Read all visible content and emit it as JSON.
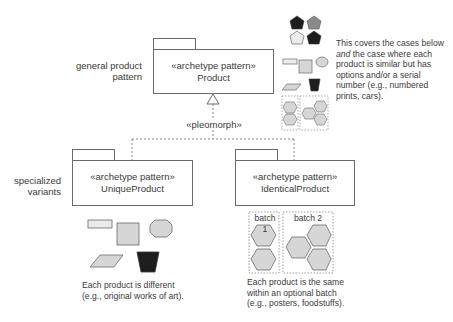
{
  "diagram": {
    "general": {
      "side_label_line1": "general product",
      "side_label_line2": "pattern",
      "stereotype": "«archetype pattern»",
      "name": "Product"
    },
    "relationship": {
      "label": "«pleomorph»"
    },
    "specialized": {
      "side_label_line1": "specialized",
      "side_label_line2": "variants"
    },
    "unique": {
      "stereotype": "«archetype pattern»",
      "name": "UniqueProduct",
      "caption_line1": "Each product is different",
      "caption_line2": "(e.g., original works of art)."
    },
    "identical": {
      "stereotype": "«archetype pattern»",
      "name": "IdenticalProduct",
      "batch1_label": "batch 1",
      "batch2_label": "batch 2",
      "caption_line1": "Each product is the same",
      "caption_line2": "within an optional batch",
      "caption_line3": "(e.g., posters, foodstuffs)."
    },
    "general_note": {
      "line1": "This covers the cases below",
      "line2_italic": "and",
      "line2_rest": " the case where each",
      "line3": "product is similar but has",
      "line4": "options and/or a serial",
      "line5": "number (e.g., numbered",
      "line6": "prints, cars)."
    },
    "colors": {
      "outline": "#6a6a6a",
      "shape_fill_light": "#d6d6d6",
      "shape_fill_pale": "#ececec",
      "shape_fill_dark": "#1e1e1e",
      "shape_fill_mid": "#8a8a8a",
      "dashed": "#888888"
    }
  }
}
